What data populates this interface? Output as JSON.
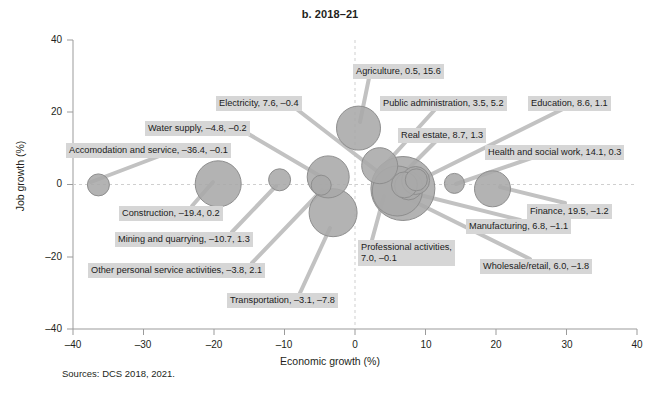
{
  "title": "b. 2018–21",
  "source_note": "Sources: DCS 2018, 2021.",
  "axes": {
    "xlabel": "Economic growth (%)",
    "ylabel": "Job growth (%)",
    "xticks": [
      "–40",
      "–30",
      "–20",
      "–10",
      "0",
      "10",
      "20",
      "30",
      "40"
    ],
    "yticks": [
      "40",
      "20",
      "0",
      "–20",
      "–40"
    ]
  },
  "colors": {
    "bubble_fill": "#a9a9a9",
    "bubble_stroke": "#8e8e8e",
    "label_bg": "#d6d6d6",
    "leader": "#c2c2c2",
    "axis": "#9b9b9b",
    "grid": "#cfcfcf",
    "text": "#231f20"
  },
  "chart_data": {
    "type": "scatter",
    "title": "b. 2018–21",
    "xlabel": "Economic growth (%)",
    "ylabel": "Job growth (%)",
    "xlim": [
      -40,
      40
    ],
    "ylim": [
      -40,
      40
    ],
    "xticks": [
      -40,
      -30,
      -20,
      -10,
      0,
      10,
      20,
      30,
      40
    ],
    "yticks": [
      -40,
      -20,
      0,
      20,
      40
    ],
    "grid": "zero-lines-only",
    "legend": "none",
    "note": "Bubble size encodes sector employment share; labels read 'Sector, economic growth, job growth'.",
    "points": [
      {
        "label": "Agriculture",
        "x": 0.5,
        "y": 15.6,
        "r": 22,
        "label_text": "Agriculture, 0.5, 15.6",
        "label_left": 353,
        "label_top": 64
      },
      {
        "label": "Electricity",
        "x": 7.6,
        "y": -0.4,
        "r": 14,
        "label_text": "Electricity, 7.6, –0.4",
        "label_left": 216,
        "label_top": 96
      },
      {
        "label": "Public administration",
        "x": 3.5,
        "y": 5.2,
        "r": 18,
        "label_text": "Public administration, 3.5, 5.2",
        "label_left": 380,
        "label_top": 96
      },
      {
        "label": "Education",
        "x": 8.6,
        "y": 1.1,
        "r": 14,
        "label_text": "Education, 8.6, 1.1",
        "label_left": 528,
        "label_top": 96
      },
      {
        "label": "Water supply",
        "x": -4.8,
        "y": -0.2,
        "r": 10,
        "label_text": "Water supply, –4.8, –0.2",
        "label_left": 145,
        "label_top": 121
      },
      {
        "label": "Real estate",
        "x": 8.7,
        "y": 1.3,
        "r": 11,
        "label_text": "Real estate, 8.7, 1.3",
        "label_left": 398,
        "label_top": 128
      },
      {
        "label": "Accomodation and service",
        "x": -36.4,
        "y": -0.1,
        "r": 11,
        "label_text": "Accomodation and service, –36.4, –0.1",
        "label_left": 66,
        "label_top": 143
      },
      {
        "label": "Health and social work",
        "x": 14.1,
        "y": 0.3,
        "r": 10,
        "label_text": "Health and social work, 14.1, 0.3",
        "label_left": 485,
        "label_top": 145
      },
      {
        "label": "Construction",
        "x": -19.4,
        "y": 0.2,
        "r": 23,
        "label_text": "Construction, –19.4, 0.2",
        "label_left": 119,
        "label_top": 206
      },
      {
        "label": "Finance",
        "x": 19.5,
        "y": -1.2,
        "r": 18,
        "label_text": "Finance, 19.5, –1.2",
        "label_left": 527,
        "label_top": 204
      },
      {
        "label": "Manufacturing",
        "x": 6.8,
        "y": -1.1,
        "r": 32,
        "label_text": "Manufacturing, 6.8, –1.1",
        "label_left": 466,
        "label_top": 219
      },
      {
        "label": "Mining and quarrying",
        "x": -10.7,
        "y": 1.3,
        "r": 11,
        "label_text": "Mining and quarrying, –10.7, 1.3",
        "label_left": 115,
        "label_top": 232
      },
      {
        "label": "Professional activities",
        "x": 7.0,
        "y": -0.1,
        "r": 13,
        "label_text": "Professional activities,\n7.0, –0.1",
        "label_left": 358,
        "label_top": 240
      },
      {
        "label": "Other personal service activities",
        "x": -3.8,
        "y": 2.1,
        "r": 21,
        "label_text": "Other personal service activities, –3.8, 2.1",
        "label_left": 88,
        "label_top": 263
      },
      {
        "label": "Wholesale/retail",
        "x": 6.0,
        "y": -1.8,
        "r": 25,
        "label_text": "Wholesale/retail, 6.0, –1.8",
        "label_left": 480,
        "label_top": 259
      },
      {
        "label": "Transportation",
        "x": -3.1,
        "y": -7.8,
        "r": 24,
        "label_text": "Transportation, –3.1, –7.8",
        "label_left": 227,
        "label_top": 293
      }
    ]
  }
}
